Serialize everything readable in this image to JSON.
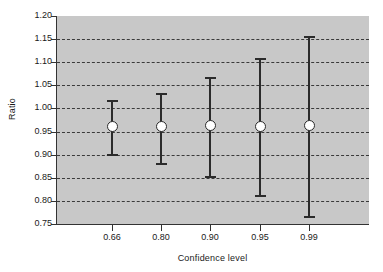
{
  "chart_data": {
    "type": "scatter",
    "title": "",
    "subtitle": "",
    "xlabel": "Confidence level",
    "ylabel": "Ratio",
    "categories": [
      "0.66",
      "0.80",
      "0.90",
      "0.95",
      "0.99"
    ],
    "x_tick_labels": [
      "0.66",
      "0.80",
      "0.90",
      "0.95",
      "0.99"
    ],
    "y_tick_labels": [
      "1.20",
      "1.15",
      "1.10",
      "1.05",
      "1.00",
      "0.95",
      "0.90",
      "0.85",
      "0.80",
      "0.75"
    ],
    "y_ticks": [
      1.2,
      1.15,
      1.1,
      1.05,
      1.0,
      0.95,
      0.9,
      0.85,
      0.8,
      0.75
    ],
    "ylim": [
      0.75,
      1.2
    ],
    "grid": true,
    "grid_style": "dashed",
    "grid_axis": "y",
    "legend": "none",
    "plot_background": "#c8c8c8",
    "figure_background": "#ffffff",
    "marker_style": "circle",
    "marker_fill": "#ffffff",
    "marker_edge": "#2b2b2b",
    "errorbar_color": "#2b2b2b",
    "series": [
      {
        "name": "Ratio with confidence interval",
        "points": [
          {
            "x_label": "0.66",
            "value": 0.961,
            "lower": 0.898,
            "upper": 1.018
          },
          {
            "x_label": "0.80",
            "value": 0.96,
            "lower": 0.877,
            "upper": 1.033
          },
          {
            "x_label": "0.90",
            "value": 0.963,
            "lower": 0.85,
            "upper": 1.068
          },
          {
            "x_label": "0.95",
            "value": 0.962,
            "lower": 0.809,
            "upper": 1.11
          },
          {
            "x_label": "0.99",
            "value": 0.963,
            "lower": 0.764,
            "upper": 1.157
          }
        ],
        "values": [
          0.961,
          0.96,
          0.963,
          0.962,
          0.963
        ],
        "lower": [
          0.898,
          0.877,
          0.85,
          0.809,
          0.764
        ],
        "upper": [
          1.018,
          1.033,
          1.068,
          1.11,
          1.157
        ]
      }
    ]
  }
}
